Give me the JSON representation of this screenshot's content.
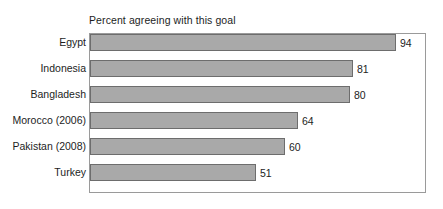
{
  "chart_data": {
    "type": "bar",
    "orientation": "horizontal",
    "title": "Percent agreeing with this goal",
    "xlabel": "",
    "ylabel": "",
    "categories": [
      "Egypt",
      "Indonesia",
      "Bangladesh",
      "Morocco (2006)",
      "Pakistan (2008)",
      "Turkey"
    ],
    "values": [
      94,
      81,
      80,
      64,
      60,
      51
    ],
    "value_labels": [
      "94",
      "81",
      "80",
      "64",
      "60",
      "51"
    ],
    "xlim": [
      0,
      103
    ],
    "grid": false,
    "legend": null,
    "bar_color": "#a9a9a9",
    "bar_edge_color": "#6d6d6d",
    "frame_color": "#9a9a9a",
    "text_color": "#1d1d1d",
    "background": "#ffffff"
  }
}
